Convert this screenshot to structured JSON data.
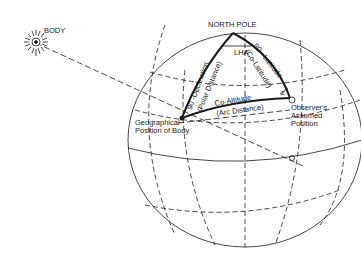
{
  "diagram": {
    "labels": {
      "body": "BODY",
      "north_pole": "NORTH POLE",
      "lha": "LHA",
      "z": "Z",
      "co_latitude_1": "90 - Latitude",
      "co_latitude_2": "(Co-Latitude)",
      "declination_1": "90 -Declination",
      "declination_2": "(Polar Distance)",
      "co_altitude_1": "Co-Altitude",
      "co_altitude_2": "(Arc Distance)",
      "gp_1": "Geographical",
      "gp_2": "Position of Body",
      "obs_1": "Observer's",
      "obs_2": "Assumed",
      "obs_3": "Position"
    },
    "colors": {
      "ink": "#1a1a1a",
      "background": "#ffffff"
    }
  }
}
